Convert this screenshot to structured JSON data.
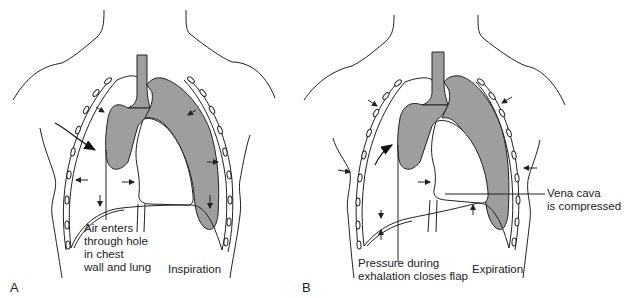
{
  "figure": {
    "colors": {
      "lung": "#9e9e9e",
      "line": "#222222",
      "background": "#ffffff"
    }
  },
  "panels": [
    {
      "letter": "A",
      "phase_label": "Inspiration",
      "annotations": [
        {
          "text": "Air enters\nthrough hole\nin chest\nwall and lung",
          "target": "hole in chest wall and lung"
        }
      ],
      "arrows": [
        "air-entry-arrow",
        "pressure-arrows-inward",
        "diaphragm-arrow-down"
      ]
    },
    {
      "letter": "B",
      "phase_label": "Expiration",
      "annotations": [
        {
          "text": "Pressure during\nexhalation closes flap",
          "target": "flap"
        },
        {
          "text": "Vena cava\nis compressed",
          "target": "vena cava"
        }
      ],
      "arrows": [
        "flap-closing-arrow",
        "pressure-arrows-inward",
        "diaphragm-arrows"
      ]
    }
  ]
}
